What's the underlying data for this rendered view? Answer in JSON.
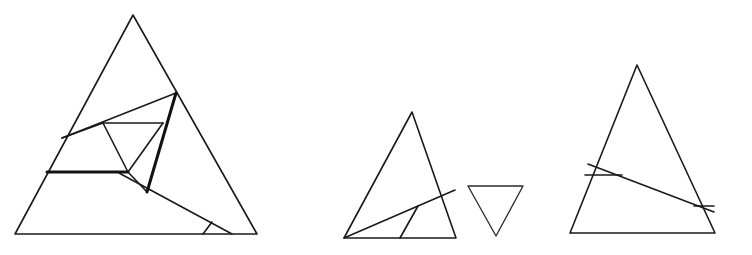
{
  "figure": {
    "background_color": "#ffffff",
    "line_color": "#1a1a1a",
    "bold_line_color": "#121212",
    "width": 752,
    "height": 255
  },
  "shapes": [
    {
      "name": "large-triangle",
      "label": "Large left triangle",
      "outline": "133,15 15,234 257,234",
      "segments": [
        {
          "name": "upper-long-diagonal",
          "path": "M 62,138 L 176,93",
          "weight": "normal"
        },
        {
          "name": "left-slope-to-apex-chord",
          "path": "M 62,138 L 103,123",
          "weight": "normal"
        },
        {
          "name": "inner-top-horizontal",
          "path": "M 103,123 L 163,123",
          "weight": "normal"
        },
        {
          "name": "inner-left-slant",
          "path": "M 103,123 L 128,172",
          "weight": "normal"
        },
        {
          "name": "inner-right-slant",
          "path": "M 163,123 L 128,172",
          "weight": "normal"
        },
        {
          "name": "bold-right-edge-chord",
          "path": "M 176,93 L 147,192",
          "weight": "bold"
        },
        {
          "name": "bold-lower-horizontal",
          "path": "M 47,172 L 128,172",
          "weight": "bold"
        },
        {
          "name": "long-base-diagonal",
          "path": "M 119,173 L 232,234",
          "weight": "normal"
        },
        {
          "name": "small-base-tick",
          "path": "M 203,234 L 212,222",
          "weight": "normal"
        },
        {
          "name": "mid-right-connector",
          "path": "M 147,192 L 128,172",
          "weight": "normal"
        }
      ]
    },
    {
      "name": "middle-triangle",
      "label": "Middle triangle",
      "outline": "412,112 344,238 456,238",
      "segments": [
        {
          "name": "base-to-right-edge-diagonal",
          "path": "M 344,238 L 455,190",
          "weight": "normal"
        },
        {
          "name": "interior-vertical-divider",
          "path": "M 400,238 L 418,206",
          "weight": "normal"
        }
      ]
    },
    {
      "name": "inverted-small-triangle",
      "label": "Small inverted triangle",
      "outline": "468,186 523,186 496,236",
      "segments": []
    },
    {
      "name": "right-triangle",
      "label": "Right triangle",
      "outline": "637,65 570,233 715,233",
      "segments": [
        {
          "name": "left-edge-to-right-diagonal",
          "path": "M 588,164 L 714,212",
          "weight": "normal"
        },
        {
          "name": "short-horizontal-left",
          "path": "M 585,175 L 622,175",
          "weight": "normal"
        },
        {
          "name": "short-horizontal-right",
          "path": "M 694,206 L 714,206",
          "weight": "normal"
        }
      ]
    }
  ]
}
